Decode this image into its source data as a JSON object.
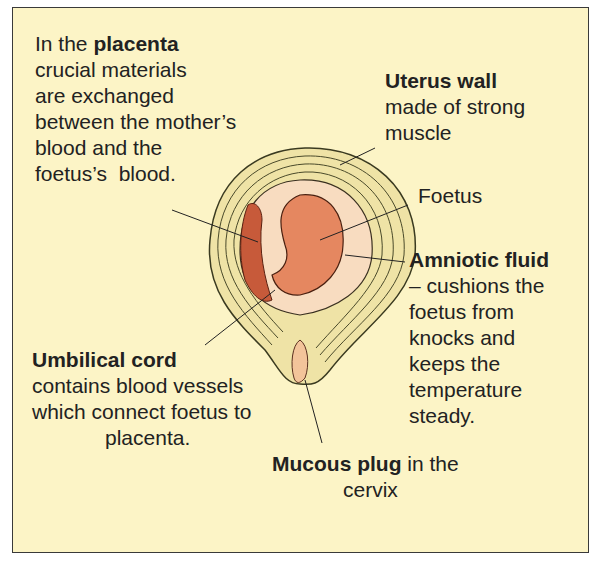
{
  "figure": {
    "background_color": "#fcf4c6",
    "labels": {
      "placenta": {
        "prefix": "In the ",
        "term": "placenta",
        "lines": [
          "crucial materials",
          "are exchanged",
          "between the mother’s",
          "blood and the",
          "foetus’s  blood."
        ]
      },
      "uterus_wall": {
        "term": "Uterus wall",
        "lines": [
          "made of strong",
          "muscle"
        ]
      },
      "foetus": {
        "term": "Foetus"
      },
      "amniotic_fluid": {
        "term": "Amniotic fluid",
        "lines": [
          "– cushions the",
          "foetus from",
          "knocks and",
          "keeps the",
          "temperature",
          "steady."
        ]
      },
      "umbilical_cord": {
        "term": "Umbilical cord",
        "lines": [
          "contains blood vessels",
          "which connect foetus to",
          "placenta."
        ]
      },
      "mucous_plug": {
        "term": "Mucous plug",
        "suffix": " in the",
        "lines": [
          "cervix"
        ]
      }
    }
  }
}
